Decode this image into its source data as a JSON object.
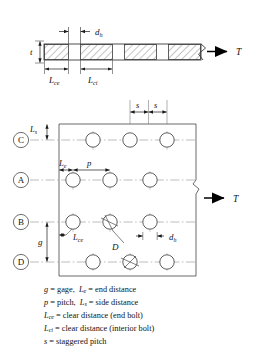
{
  "figure": {
    "colors": {
      "line": "#3a3a3a",
      "centerline": "#9a9a9a",
      "hatch": "#555555",
      "text": "#111111",
      "plate_fill": "#ffffff"
    }
  },
  "elevation": {
    "thickness_label": "t",
    "hole_dim_label": "d",
    "hole_dim_sub": "h",
    "clear_end_label": "L",
    "clear_end_sub": "ce",
    "clear_interior_label": "L",
    "clear_interior_sub": "ci",
    "tension_label": "T"
  },
  "plan": {
    "row_labels": [
      "C",
      "A",
      "B",
      "D"
    ],
    "tension_label": "T",
    "dims": {
      "side_distance": "L",
      "side_distance_sub": "s",
      "end_distance": "L",
      "end_distance_sub": "e",
      "pitch": "p",
      "gage": "g",
      "clear_end": "L",
      "clear_end_sub": "ce",
      "bolt_diameter": "D",
      "hole_diameter": "d",
      "hole_diameter_sub": "h",
      "staggered_pitch": "s"
    }
  },
  "legend": {
    "lines": [
      {
        "sym": "g",
        "sub": "",
        "text": " = gage,",
        "sym2": "L",
        "sub2": "e",
        "text2": " = end distance"
      },
      {
        "sym": "p",
        "sub": "",
        "text": " = pitch,",
        "sym2": "L",
        "sub2": "s",
        "text2": " = side distance"
      },
      {
        "sym": "L",
        "sub": "ce",
        "text": " = clear distance (end bolt)",
        "sym2": "",
        "sub2": "",
        "text2": ""
      },
      {
        "sym": "L",
        "sub": "ci",
        "text": " = clear distance (interior bolt)",
        "sym2": "",
        "sub2": "",
        "text2": ""
      },
      {
        "sym": "s",
        "sub": "",
        "text": " = staggered pitch",
        "sym2": "",
        "sub2": "",
        "text2": ""
      }
    ]
  }
}
